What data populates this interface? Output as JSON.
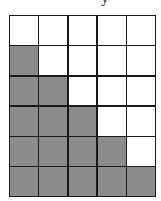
{
  "top_glyph": "y",
  "grid": {
    "rows": 6,
    "cols": 5,
    "shaded_color": "#8c8c8c",
    "empty_color": "#ffffff",
    "line_color": "#1a1a1a",
    "shaded_counts_per_row": [
      0,
      1,
      2,
      3,
      4,
      5
    ]
  }
}
